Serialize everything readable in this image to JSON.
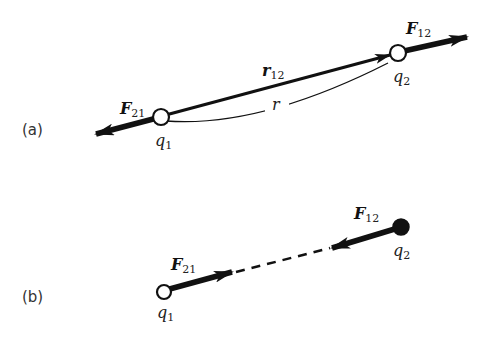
{
  "figure": {
    "panel_a": {
      "label": "(a)",
      "charge1": {
        "symbol": "q",
        "subscript": "1",
        "fill": "open"
      },
      "charge2": {
        "symbol": "q",
        "subscript": "2",
        "fill": "open"
      },
      "force_on_1": {
        "symbol": "F",
        "subscript": "21",
        "direction": "away from q2"
      },
      "force_on_2": {
        "symbol": "F",
        "subscript": "12",
        "direction": "away from q1"
      },
      "displacement": {
        "symbol": "r",
        "subscript": "12"
      },
      "distance": {
        "symbol": "r"
      }
    },
    "panel_b": {
      "label": "(b)",
      "charge1": {
        "symbol": "q",
        "subscript": "1",
        "fill": "open"
      },
      "charge2": {
        "symbol": "q",
        "subscript": "2",
        "fill": "solid"
      },
      "force_on_1": {
        "symbol": "F",
        "subscript": "21",
        "direction": "toward q2"
      },
      "force_on_2": {
        "symbol": "F",
        "subscript": "12",
        "direction": "toward q1"
      }
    }
  },
  "colors": {
    "ink": "#111111",
    "background": "#ffffff"
  }
}
